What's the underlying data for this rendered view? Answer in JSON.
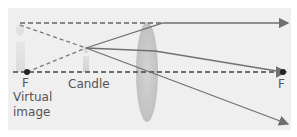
{
  "diagram": {
    "labels": {
      "focal_left": "F",
      "focal_right": "F",
      "virtual_image_line1": "Virtual",
      "virtual_image_line2": "image",
      "candle": "Candle"
    },
    "colors": {
      "background": "#efefef",
      "ray": "#707070",
      "dashed": "#555555",
      "lens": "#c9c9c9",
      "focal_point": "#222222"
    }
  }
}
